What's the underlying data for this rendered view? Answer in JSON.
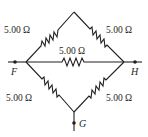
{
  "diagram": {
    "type": "resistor-network",
    "colors": {
      "ink": "#231f20",
      "background": "#ffffff"
    },
    "nodes": {
      "F": {
        "label": "F"
      },
      "H": {
        "label": "H"
      },
      "G": {
        "label": "G"
      }
    },
    "resistors": [
      {
        "id": "top-left",
        "label": "5.00 Ω"
      },
      {
        "id": "top-right",
        "label": "5.00 Ω"
      },
      {
        "id": "middle",
        "label": "5.00 Ω"
      },
      {
        "id": "bottom-left",
        "label": "5.00 Ω"
      },
      {
        "id": "bottom-right",
        "label": "5.00 Ω"
      }
    ]
  }
}
